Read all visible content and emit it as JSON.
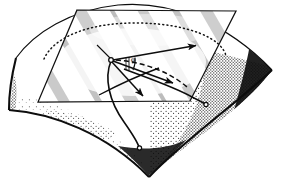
{
  "figure": {
    "type": "geometry-diagram",
    "background_color": "#ffffff",
    "ink_color": "#0d0d0d",
    "canvas": {
      "width": 283,
      "height": 191
    }
  },
  "labels": {
    "angle_phi": "φ"
  },
  "surface": {
    "name": "saddle-surface",
    "description": "Hyperbolic-paraboloid patch, stippled shading, dark edges",
    "outline_path": "M 16 58 C 26 38 42 22 62 13 C 86 3 120 2 152 6 C 190 11 228 26 272 70 C 262 84 246 100 226 116 C 198 138 170 158 148 176 C 130 156 108 140 82 128 C 58 117 34 112 10 110 C 12 95 13 76 16 58 Z",
    "top_edge": "M 16 58 C 34 33 70 10 118 5 C 172 0 228 24 272 70",
    "left_edge": "M 16 58 C 12 80 10 96 10 110",
    "bottom_edge": "M 10 110 C 54 114 108 134 148 176",
    "right_edge": "M 272 70 C 236 104 184 140 148 176",
    "fill_color": "#fbfbfb",
    "stipple_color": "#1a1a1a",
    "stipple_density": "medium"
  },
  "tangent_plane": {
    "name": "tangent-plane",
    "shape": "parallelogram",
    "corners": [
      {
        "label": "top-left",
        "x": 77,
        "y": 10
      },
      {
        "label": "top-right",
        "x": 236,
        "y": 11
      },
      {
        "label": "bottom-right",
        "x": 190,
        "y": 101
      },
      {
        "label": "bottom-left",
        "x": 38,
        "y": 102
      }
    ],
    "stroke_color": "#111111",
    "hatch": "diagonal-streaks",
    "hatch_color": "#8e8e8e"
  },
  "origin_point": {
    "name": "tangency-point",
    "x": 111,
    "y": 60,
    "style": "small-open-circle"
  },
  "vectors": [
    {
      "name": "principal-vector-long",
      "from": [
        111,
        60
      ],
      "to": [
        199,
        45
      ],
      "arrow": true
    },
    {
      "name": "tangent-vector-right",
      "from": [
        111,
        60
      ],
      "to": [
        177,
        85
      ],
      "arrow": true
    },
    {
      "name": "tangent-vector-lower",
      "from": [
        111,
        60
      ],
      "to": [
        146,
        99
      ],
      "arrow": true
    },
    {
      "name": "tangent-vector-down",
      "from": [
        111,
        60
      ],
      "to": [
        128,
        90
      ],
      "arrow": true
    }
  ],
  "dashed_curve": {
    "name": "dashed-normal-section",
    "description": "dashed arc in tangent plane from origin curving right-down",
    "path": "M 115 60 C 140 62 166 70 186 86",
    "dash": "5,3"
  },
  "dotted_ellipse": {
    "name": "dotted-indicatrix-arc",
    "description": "dotted ellipse arc across the tangent plane",
    "path": "M 44 59 C 54 36 92 22 140 23 C 188 24 222 38 226 56",
    "dot_pattern": "1,3"
  },
  "angle_marker": {
    "name": "angle-phi-marker",
    "center": [
      111,
      60
    ],
    "arc_radius": 24,
    "label_position": [
      134,
      64
    ],
    "has_tick_marks": true
  },
  "surface_curves": [
    {
      "name": "surface-curve-left",
      "path": "M 111 60 C 104 76 108 100 124 122 C 132 132 138 140 140 147",
      "endpoint": [
        140,
        147
      ],
      "endpoint_style": "small-open-circle"
    },
    {
      "name": "surface-curve-right",
      "path": "M 124 68 C 150 78 174 86 192 96 C 198 99 203 101 206 103",
      "endpoint": [
        206,
        103
      ],
      "endpoint_style": "small-open-circle"
    },
    {
      "name": "surface-curve-cross",
      "path": "M 100 94 C 118 84 140 74 158 68",
      "endpoint": null,
      "endpoint_style": "none"
    }
  ],
  "normal_line": {
    "name": "normal-line",
    "from": [
      111,
      60
    ],
    "to": [
      96,
      44
    ]
  }
}
